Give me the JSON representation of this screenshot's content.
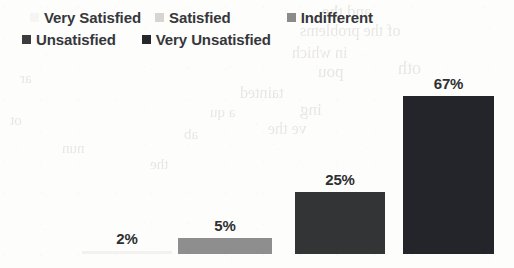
{
  "chart_data": {
    "type": "bar",
    "title": "",
    "subtitle": "",
    "xlabel": "",
    "ylabel": "",
    "grid": false,
    "legend_position": "top",
    "ylim": [
      0,
      75
    ],
    "categories": [
      "Very Satisfied",
      "Satisfied",
      "Indifferent",
      "Unsatisfied",
      "Very Unsatisfied"
    ],
    "values": [
      null,
      null,
      2,
      5,
      25
    ],
    "bars": [
      {
        "category": "Indifferent",
        "value": 2,
        "label": "2%",
        "color": "#f3f2f0",
        "x": 82,
        "width": 90,
        "height": 3
      },
      {
        "category": "Unsatisfied",
        "value": 5,
        "label": "5%",
        "color": "#8e8e8e",
        "x": 178,
        "width": 94,
        "height": 16
      },
      {
        "category": "Very Unsatisfied",
        "value": 25,
        "label": "25%",
        "color": "#333436",
        "x": 295,
        "width": 90,
        "height": 62
      },
      {
        "category": "Very Unsatisfied",
        "value": 67,
        "label": "67%",
        "color": "#24252a",
        "x": 403,
        "width": 91,
        "height": 158
      }
    ]
  },
  "legend": {
    "rows": [
      [
        {
          "label": "Very Satisfied",
          "color": "#f6f5f3"
        },
        {
          "label": "Satisfied",
          "color": "#d6d5d2"
        },
        {
          "label": "Indifferent",
          "color": "#8b8b8b"
        }
      ],
      [
        {
          "label": "Unsatisfied",
          "color": "#3b3c3e"
        },
        {
          "label": "Very Unsatisfied",
          "color": "#26272b"
        }
      ]
    ]
  },
  "background": {
    "ghost_text": [
      {
        "text": "and the",
        "x": 322,
        "y": 2,
        "size": 17
      },
      {
        "text": "of the problems",
        "x": 300,
        "y": 22,
        "size": 16
      },
      {
        "text": "in which",
        "x": 292,
        "y": 44,
        "size": 16
      },
      {
        "text": "oth",
        "x": 398,
        "y": 58,
        "size": 18
      },
      {
        "text": "pou",
        "x": 318,
        "y": 62,
        "size": 17
      },
      {
        "text": "tainted",
        "x": 240,
        "y": 84,
        "size": 16
      },
      {
        "text": "ing",
        "x": 300,
        "y": 100,
        "size": 17
      },
      {
        "text": "a qu",
        "x": 210,
        "y": 104,
        "size": 15
      },
      {
        "text": "ve the",
        "x": 268,
        "y": 120,
        "size": 16
      },
      {
        "text": "ab",
        "x": 184,
        "y": 126,
        "size": 15
      },
      {
        "text": "nun",
        "x": 62,
        "y": 140,
        "size": 15
      },
      {
        "text": "the",
        "x": 150,
        "y": 156,
        "size": 15
      },
      {
        "text": "ar",
        "x": 20,
        "y": 70,
        "size": 15
      },
      {
        "text": "ot",
        "x": 10,
        "y": 112,
        "size": 15
      }
    ]
  }
}
